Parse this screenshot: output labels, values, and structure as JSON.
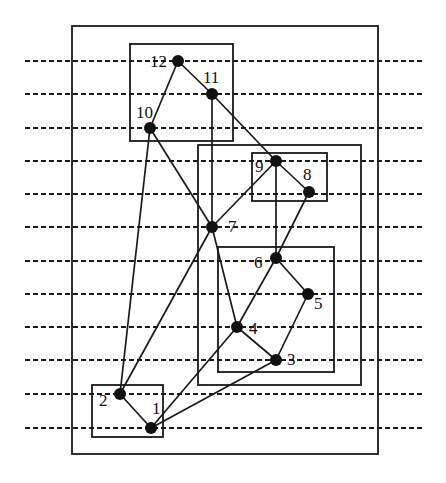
{
  "diagram": {
    "type": "layered-graph-with-clusters",
    "colors": {
      "stroke": "#1a1a1a",
      "node": "#111111",
      "background": "#ffffff"
    },
    "layers_y": [
      61,
      94,
      128,
      161,
      194,
      227,
      261,
      294,
      327,
      360,
      394,
      428
    ],
    "layer_line": {
      "x1": 25,
      "x2": 425
    },
    "clusters": [
      {
        "id": "outer",
        "x": 72,
        "y": 26,
        "w": 306,
        "h": 428
      },
      {
        "id": "box-12-11-10",
        "x": 130,
        "y": 44,
        "w": 103,
        "h": 97
      },
      {
        "id": "box-9-8-6-5-4-3",
        "x": 198,
        "y": 145,
        "w": 163,
        "h": 240
      },
      {
        "id": "box-9-8",
        "x": 252,
        "y": 153,
        "w": 75,
        "h": 48
      },
      {
        "id": "box-6-5-4-3",
        "x": 218,
        "y": 247,
        "w": 116,
        "h": 125
      },
      {
        "id": "box-2-1",
        "x": 92,
        "y": 385,
        "w": 71,
        "h": 52
      }
    ],
    "nodes": [
      {
        "id": "12",
        "label": "12",
        "x": 178,
        "y": 61,
        "lx": 150,
        "ly": 67
      },
      {
        "id": "11",
        "label": "11",
        "x": 212,
        "y": 94,
        "lx": 203,
        "ly": 83
      },
      {
        "id": "10",
        "label": "10",
        "x": 150,
        "y": 128,
        "lx": 136,
        "ly": 118
      },
      {
        "id": "9",
        "label": "9",
        "x": 276,
        "y": 161,
        "lx": 255,
        "ly": 172
      },
      {
        "id": "8",
        "label": "8",
        "x": 309,
        "y": 192,
        "lx": 303,
        "ly": 180
      },
      {
        "id": "7",
        "label": "7",
        "x": 212,
        "y": 227,
        "lx": 228,
        "ly": 232
      },
      {
        "id": "6",
        "label": "6",
        "x": 276,
        "y": 258,
        "lx": 254,
        "ly": 268
      },
      {
        "id": "5",
        "label": "5",
        "x": 308,
        "y": 294,
        "lx": 314,
        "ly": 309
      },
      {
        "id": "4",
        "label": "4",
        "x": 237,
        "y": 327,
        "lx": 249,
        "ly": 334
      },
      {
        "id": "3",
        "label": "3",
        "x": 276,
        "y": 360,
        "lx": 287,
        "ly": 365
      },
      {
        "id": "2",
        "label": "2",
        "x": 120,
        "y": 394,
        "lx": 99,
        "ly": 406
      },
      {
        "id": "1",
        "label": "1",
        "x": 151,
        "y": 428,
        "lx": 152,
        "ly": 414
      }
    ],
    "edges": [
      [
        "12",
        "10"
      ],
      [
        "12",
        "11"
      ],
      [
        "11",
        "9"
      ],
      [
        "11",
        "7"
      ],
      [
        "10",
        "7"
      ],
      [
        "10",
        "2"
      ],
      [
        "9",
        "7"
      ],
      [
        "9",
        "8"
      ],
      [
        "9",
        "6"
      ],
      [
        "8",
        "6"
      ],
      [
        "7",
        "2"
      ],
      [
        "7",
        "4"
      ],
      [
        "6",
        "4"
      ],
      [
        "6",
        "5"
      ],
      [
        "5",
        "3"
      ],
      [
        "4",
        "3"
      ],
      [
        "4",
        "1"
      ],
      [
        "3",
        "1"
      ],
      [
        "2",
        "1"
      ]
    ]
  }
}
